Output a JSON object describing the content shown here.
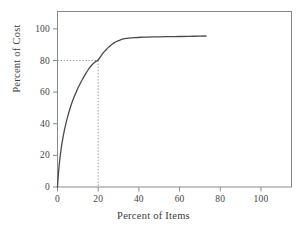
{
  "chart_data": {
    "type": "line",
    "title": "",
    "subtitle": "",
    "xlabel": "Percent of Items",
    "ylabel": "Percent of Cost",
    "xlim": [
      0,
      115
    ],
    "ylim": [
      0,
      111
    ],
    "xticks": [
      0,
      20,
      40,
      60,
      80,
      100
    ],
    "xtick_labels": [
      "0",
      "20",
      "40",
      "60",
      "80",
      "100"
    ],
    "yticks": [
      0,
      20,
      40,
      60,
      80,
      100
    ],
    "ytick_labels": [
      "0",
      "20",
      "40",
      "60",
      "80",
      "100"
    ],
    "grid": false,
    "legend": null,
    "series": [
      {
        "name": "Cumulative cost curve",
        "color": "#4a4a4a",
        "x": [
          0,
          0.5,
          1,
          2,
          3,
          4,
          5,
          6,
          7,
          8,
          9,
          10,
          11,
          12,
          13,
          14,
          15,
          16,
          17,
          18,
          19,
          20,
          21,
          22,
          23,
          24,
          25,
          26,
          27,
          28,
          29,
          30,
          31,
          32,
          33,
          34,
          35,
          38,
          41,
          44,
          47,
          50,
          55,
          60,
          65,
          70,
          73
        ],
        "y": [
          0,
          9,
          16,
          26,
          33.5,
          39.5,
          44.5,
          49,
          53,
          56.5,
          59.5,
          62.5,
          65,
          67.5,
          69.8,
          72,
          74,
          75.8,
          77.3,
          78.6,
          79.5,
          80.3,
          82.2,
          84,
          85.6,
          87,
          88.3,
          89.4,
          90.4,
          91.3,
          92,
          92.6,
          93.1,
          93.5,
          93.8,
          94,
          94.2,
          94.5,
          94.7,
          94.8,
          94.9,
          95,
          95.1,
          95.2,
          95.3,
          95.4,
          95.5
        ]
      }
    ],
    "annotations": [
      {
        "name": "eighty-twenty-reference",
        "type": "dotted-guide",
        "x": 20,
        "y": 80,
        "description": "Dotted guide lines marking 20 percent of items accounting for 80 percent of cost"
      }
    ],
    "axis_color": "#808080",
    "tick_color": "#808080",
    "guide_color": "#9a9a9a",
    "background": "#ffffff"
  }
}
